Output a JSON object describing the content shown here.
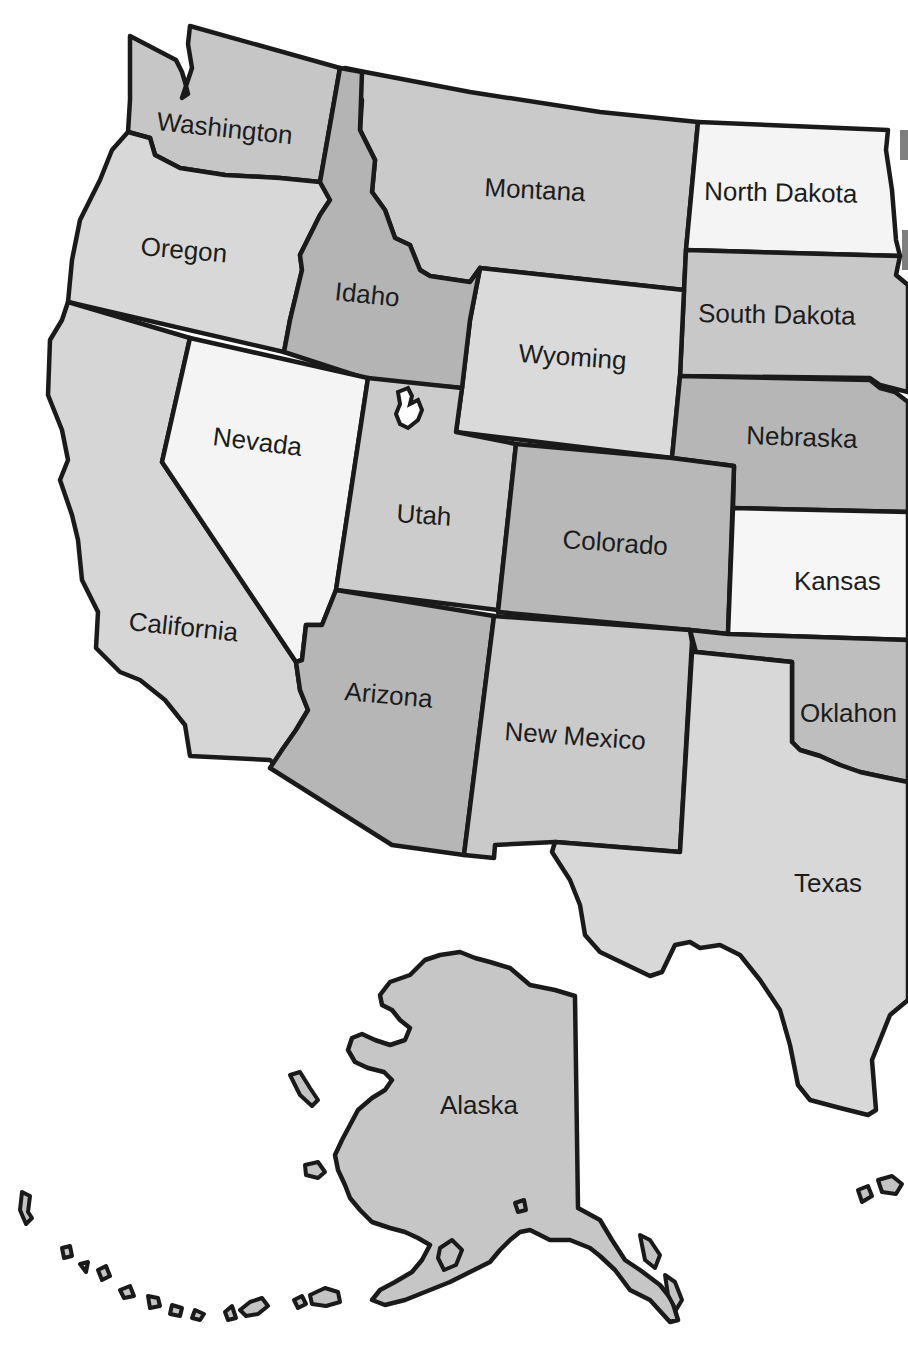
{
  "map": {
    "title": "Western United States",
    "colors": {
      "white": "#f4f4f4",
      "light": "#d8d8d8",
      "medium": "#c6c6c6",
      "dark": "#b4b4b4",
      "border": "#1a1a1a",
      "text": "#1c1c1c"
    },
    "states": [
      {
        "name": "Washington",
        "label": "Washington",
        "shade": "medium"
      },
      {
        "name": "Oregon",
        "label": "Oregon",
        "shade": "light"
      },
      {
        "name": "Idaho",
        "label": "Idaho",
        "shade": "dark"
      },
      {
        "name": "Montana",
        "label": "Montana",
        "shade": "medium"
      },
      {
        "name": "North Dakota",
        "label": "North Dakota",
        "shade": "white"
      },
      {
        "name": "South Dakota",
        "label": "South Dakota",
        "shade": "medium"
      },
      {
        "name": "Wyoming",
        "label": "Wyoming",
        "shade": "light"
      },
      {
        "name": "Nebraska",
        "label": "Nebraska",
        "shade": "dark"
      },
      {
        "name": "California",
        "label": "California",
        "shade": "light"
      },
      {
        "name": "Nevada",
        "label": "Nevada",
        "shade": "white"
      },
      {
        "name": "Utah",
        "label": "Utah",
        "shade": "light"
      },
      {
        "name": "Colorado",
        "label": "Colorado",
        "shade": "dark"
      },
      {
        "name": "Kansas",
        "label": "Kansas",
        "shade": "white"
      },
      {
        "name": "Arizona",
        "label": "Arizona",
        "shade": "dark"
      },
      {
        "name": "New Mexico",
        "label": "New Mexico",
        "shade": "medium"
      },
      {
        "name": "Oklahoma",
        "label": "Oklahon",
        "shade": "dark"
      },
      {
        "name": "Texas",
        "label": "Texas",
        "shade": "light"
      },
      {
        "name": "Alaska",
        "label": "Alaska",
        "shade": "medium"
      }
    ]
  }
}
